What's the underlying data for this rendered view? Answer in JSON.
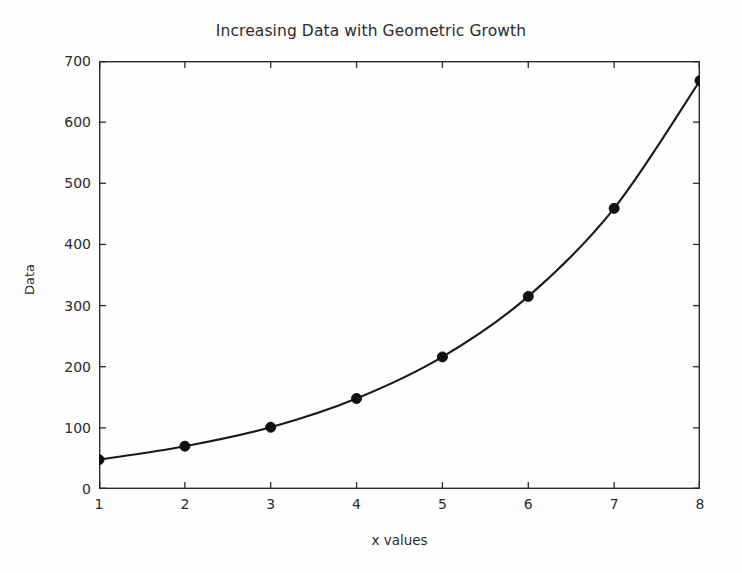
{
  "chart_data": {
    "type": "line",
    "title": "Increasing Data with Geometric Growth",
    "xlabel": "x values",
    "ylabel": "Data",
    "x": [
      1,
      2,
      3,
      4,
      5,
      6,
      7,
      8
    ],
    "values": [
      48,
      70,
      101,
      148,
      216,
      315,
      459,
      668
    ],
    "series": [
      {
        "name": "Data",
        "values": [
          48,
          70,
          101,
          148,
          216,
          315,
          459,
          668
        ]
      }
    ],
    "xlim": [
      1,
      8
    ],
    "ylim": [
      0,
      700
    ],
    "xticks": [
      1,
      2,
      3,
      4,
      5,
      6,
      7,
      8
    ],
    "yticks": [
      0,
      100,
      200,
      300,
      400,
      500,
      600,
      700
    ],
    "xtick_labels": [
      "1",
      "2",
      "3",
      "4",
      "5",
      "6",
      "7",
      "8"
    ],
    "ytick_labels": [
      "0",
      "100",
      "200",
      "300",
      "400",
      "500",
      "600",
      "700"
    ],
    "grid": false,
    "legend": false,
    "legend_position": "none",
    "marker": "circle",
    "line_color": "#1a1a1a",
    "marker_color": "#111111",
    "background_color": "#fefefe",
    "axis_color": "#2b2b2b"
  }
}
